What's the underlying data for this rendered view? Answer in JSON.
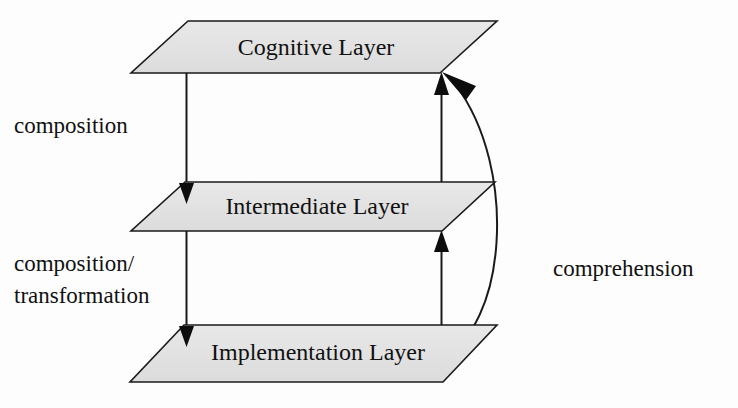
{
  "diagram": {
    "background_color": "#fdfdfd",
    "plane_fill_color": "#e3e3e3",
    "stroke_color": "#1a1a1a",
    "text_color": "#111111",
    "layers": [
      {
        "id": "cognitive",
        "label": "Cognitive Layer",
        "order": 1
      },
      {
        "id": "intermediate",
        "label": "Intermediate Layer",
        "order": 2
      },
      {
        "id": "implementation",
        "label": "Implementation Layer",
        "order": 3
      }
    ],
    "edge_labels": [
      {
        "id": "composition",
        "text": "composition",
        "side": "left"
      },
      {
        "id": "composition-transformation-line1",
        "text": "composition/",
        "side": "left"
      },
      {
        "id": "composition-transformation-line2",
        "text": "transformation",
        "side": "left"
      },
      {
        "id": "comprehension",
        "text": "comprehension",
        "side": "right"
      }
    ],
    "arrows": [
      {
        "id": "cognitive-to-intermediate",
        "label": "composition",
        "direction": "down",
        "from": "cognitive",
        "to": "intermediate"
      },
      {
        "id": "intermediate-to-implementation",
        "label": "composition/transformation",
        "direction": "down",
        "from": "intermediate",
        "to": "implementation"
      },
      {
        "id": "implementation-to-intermediate",
        "label": "comprehension",
        "direction": "up",
        "from": "implementation",
        "to": "intermediate"
      },
      {
        "id": "intermediate-to-cognitive",
        "label": "comprehension",
        "direction": "up",
        "from": "intermediate",
        "to": "cognitive"
      },
      {
        "id": "implementation-to-cognitive-arc",
        "label": "comprehension",
        "direction": "up",
        "from": "implementation",
        "to": "cognitive",
        "shape": "curved"
      }
    ]
  }
}
